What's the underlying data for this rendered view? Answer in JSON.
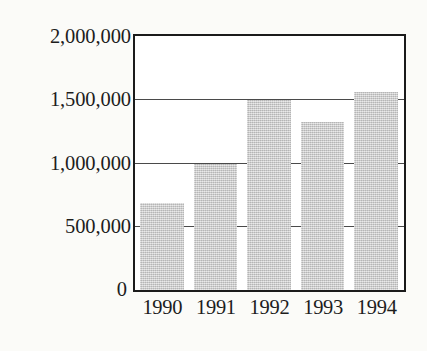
{
  "chart_data": {
    "type": "bar",
    "title": "",
    "subtitle": "",
    "xlabel": "",
    "ylabel": "",
    "categories": [
      "1990",
      "1991",
      "1992",
      "1993",
      "1994"
    ],
    "values": [
      690000,
      1000000,
      1500000,
      1325000,
      1565000
    ],
    "series": [
      {
        "name": "",
        "values": [
          690000,
          1000000,
          1500000,
          1325000,
          1565000
        ]
      }
    ],
    "ylim": [
      0,
      2000000
    ],
    "ytick_labels": [
      "2,000,000",
      "1,500,000",
      "1,000,000",
      "500,000",
      "0"
    ],
    "ytick_values": [
      2000000,
      1500000,
      1000000,
      500000,
      0
    ],
    "xtick_labels": [
      "1990",
      "1991",
      "1992",
      "1993",
      "1994"
    ],
    "grid": true,
    "grid_axis": "y",
    "legend": false,
    "legend_position": "none",
    "annotations": [],
    "bar_color": "#c9c9c9",
    "axis_color": "#1b1b1b",
    "grid_color": "#4a4a4a",
    "background_color": "#fbfbf8",
    "plot_background_color": "#ffffff"
  },
  "axes": {
    "y": {
      "ticks": [
        {
          "label": "2,000,000",
          "value": 2000000
        },
        {
          "label": "1,500,000",
          "value": 1500000
        },
        {
          "label": "1,000,000",
          "value": 1000000
        },
        {
          "label": "500,000",
          "value": 500000
        },
        {
          "label": "0",
          "value": 0
        }
      ]
    },
    "x": {
      "ticks": [
        {
          "label": "1990"
        },
        {
          "label": "1991"
        },
        {
          "label": "1992"
        },
        {
          "label": "1993"
        },
        {
          "label": "1994"
        }
      ]
    }
  }
}
